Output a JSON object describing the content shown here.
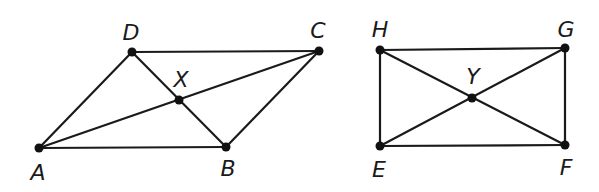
{
  "figures": [
    {
      "name": "parallelogram-ABCD",
      "points": {
        "A": {
          "label": "A",
          "x": 39,
          "y": 148,
          "lx": 38,
          "ly": 180
        },
        "B": {
          "label": "B",
          "x": 226,
          "y": 147,
          "lx": 228,
          "ly": 176
        },
        "C": {
          "label": "C",
          "x": 319,
          "y": 51,
          "lx": 318,
          "ly": 38
        },
        "D": {
          "label": "D",
          "x": 132,
          "y": 52,
          "lx": 131,
          "ly": 40
        },
        "X": {
          "label": "X",
          "x": 179,
          "y": 100,
          "lx": 181,
          "ly": 87
        }
      },
      "segments": [
        [
          "A",
          "B"
        ],
        [
          "B",
          "C"
        ],
        [
          "C",
          "D"
        ],
        [
          "D",
          "A"
        ],
        [
          "A",
          "C"
        ],
        [
          "B",
          "D"
        ]
      ]
    },
    {
      "name": "rectangle-EFGH",
      "points": {
        "E": {
          "label": "E",
          "x": 380,
          "y": 146,
          "lx": 379,
          "ly": 177
        },
        "F": {
          "label": "F",
          "x": 565,
          "y": 145,
          "lx": 566,
          "ly": 175
        },
        "G": {
          "label": "G",
          "x": 565,
          "y": 48,
          "lx": 566,
          "ly": 37
        },
        "H": {
          "label": "H",
          "x": 380,
          "y": 50,
          "lx": 380,
          "ly": 37
        },
        "Y": {
          "label": "Y",
          "x": 472,
          "y": 98,
          "lx": 473,
          "ly": 84
        }
      },
      "segments": [
        [
          "E",
          "F"
        ],
        [
          "F",
          "G"
        ],
        [
          "G",
          "H"
        ],
        [
          "H",
          "E"
        ],
        [
          "E",
          "G"
        ],
        [
          "F",
          "H"
        ]
      ]
    }
  ],
  "colors": {
    "line": "#1a1a1a",
    "point": "#111111",
    "background": "#ffffff"
  }
}
